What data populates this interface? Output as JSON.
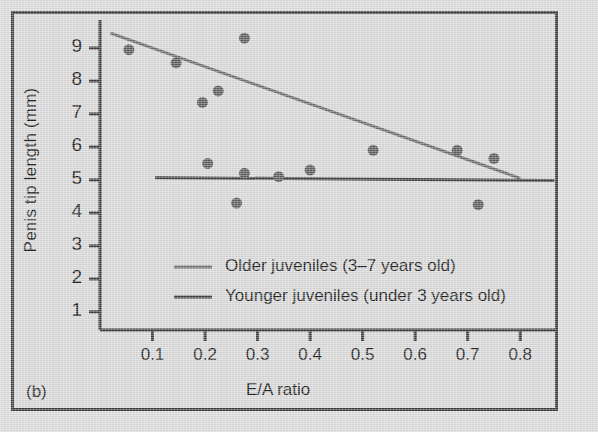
{
  "figure": {
    "panel_letter": "(b)",
    "background_color": "#d9d9d9",
    "frame_color": "#3a3a3a"
  },
  "chart_data": {
    "type": "scatter",
    "title": "",
    "xlabel": "E/A ratio",
    "ylabel": "Penis tip length (mm)",
    "xlim": [
      0.0,
      0.87
    ],
    "ylim": [
      0.45,
      9.85
    ],
    "xticks": [
      0.1,
      0.2,
      0.3,
      0.4,
      0.5,
      0.6,
      0.7,
      0.8
    ],
    "xtick_labels": [
      "0.1",
      "0.2",
      "0.3",
      "0.4",
      "0.5",
      "0.6",
      "0.7",
      "0.8"
    ],
    "yticks": [
      1,
      2,
      3,
      4,
      5,
      6,
      7,
      8,
      9
    ],
    "ytick_labels": [
      "1",
      "2",
      "3",
      "4",
      "5",
      "6",
      "7",
      "8",
      "9"
    ],
    "grid": false,
    "legend_position": "center",
    "marker_color": "#5c5c5c",
    "marker_size_px": 11,
    "points": [
      {
        "x": 0.055,
        "y": 8.95,
        "group": "older"
      },
      {
        "x": 0.145,
        "y": 8.55,
        "group": "older"
      },
      {
        "x": 0.195,
        "y": 7.35,
        "group": "older"
      },
      {
        "x": 0.225,
        "y": 7.7,
        "group": "older"
      },
      {
        "x": 0.275,
        "y": 9.3,
        "group": "older"
      },
      {
        "x": 0.52,
        "y": 5.9,
        "group": "older"
      },
      {
        "x": 0.68,
        "y": 5.9,
        "group": "older"
      },
      {
        "x": 0.75,
        "y": 5.65,
        "group": "older"
      },
      {
        "x": 0.205,
        "y": 5.5,
        "group": "younger"
      },
      {
        "x": 0.26,
        "y": 4.3,
        "group": "younger"
      },
      {
        "x": 0.275,
        "y": 5.2,
        "group": "younger"
      },
      {
        "x": 0.34,
        "y": 5.1,
        "group": "younger"
      },
      {
        "x": 0.4,
        "y": 5.3,
        "group": "younger"
      },
      {
        "x": 0.72,
        "y": 4.25,
        "group": "younger"
      }
    ],
    "series": [
      {
        "name": "Older juveniles (3–7 years old)",
        "key": "older",
        "line_color": "#6b6b6b",
        "line_width_px": 3,
        "fit_line": {
          "x_start": 0.02,
          "y_start": 9.45,
          "x_end": 0.8,
          "y_end": 5.05
        }
      },
      {
        "name": "Younger juveniles (under 3 years old)",
        "key": "younger",
        "line_color": "#3d3d3d",
        "line_width_px": 3,
        "fit_line": {
          "x_start": 0.105,
          "y_start": 5.07,
          "x_end": 0.865,
          "y_end": 4.98
        }
      }
    ],
    "legend": [
      {
        "label": "Older juveniles (3–7 years old)",
        "swatch_color": "#6b6b6b"
      },
      {
        "label": "Younger juveniles (under 3 years old)",
        "swatch_color": "#3d3d3d"
      }
    ]
  }
}
